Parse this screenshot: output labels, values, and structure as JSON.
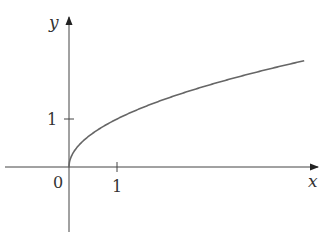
{
  "chart_data": {
    "type": "line",
    "title": "",
    "function": "y = sqrt(x)",
    "xlabel": "x",
    "ylabel": "y",
    "origin_label": "0",
    "x_ticks": [
      {
        "value": 1,
        "label": "1"
      }
    ],
    "y_ticks": [
      {
        "value": 1,
        "label": "1"
      }
    ],
    "xlim": [
      -1.4,
      5.2
    ],
    "ylim": [
      -1.9,
      3.2
    ],
    "grid": false,
    "legend": null,
    "series": [
      {
        "name": "sqrt(x)",
        "x": [
          0,
          0.05,
          0.25,
          0.5,
          1,
          1.5,
          2,
          2.5,
          3,
          3.5,
          4,
          4.5,
          4.9
        ],
        "y": [
          0,
          0.224,
          0.5,
          0.707,
          1,
          1.225,
          1.414,
          1.581,
          1.732,
          1.871,
          2,
          2.121,
          2.214
        ],
        "color": "#555555"
      }
    ]
  }
}
